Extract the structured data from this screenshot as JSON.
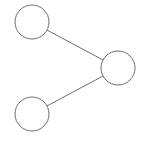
{
  "diagram": {
    "type": "tree",
    "stroke_color": "#6e6e6e",
    "fill_color": "#ffffff",
    "nodes": [
      {
        "id": "node-top-left",
        "cx": 32,
        "cy": 22,
        "r": 17,
        "label": ""
      },
      {
        "id": "node-right",
        "cx": 118,
        "cy": 68,
        "r": 17,
        "label": ""
      },
      {
        "id": "node-bottom-left",
        "cx": 32,
        "cy": 114,
        "r": 17,
        "label": ""
      }
    ],
    "edges": [
      {
        "from": "node-top-left",
        "to": "node-right"
      },
      {
        "from": "node-bottom-left",
        "to": "node-right"
      }
    ]
  }
}
